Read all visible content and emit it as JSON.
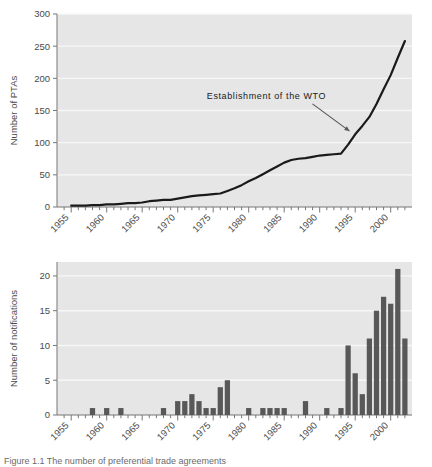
{
  "figure": {
    "caption": "Figure 1.1   The number of preferential trade agreements",
    "background_color": "#e6e6e6",
    "line_color": "#1a1a1a",
    "bar_color": "#585858",
    "grid_color": "#f7f7f7",
    "axis_color": "#777777"
  },
  "chart_data": [
    {
      "type": "line",
      "title": "",
      "xlabel": "",
      "ylabel": "Number of PTAs",
      "xlim": [
        1953,
        2003
      ],
      "ylim": [
        0,
        300
      ],
      "yticks": [
        0,
        50,
        100,
        150,
        200,
        250,
        300
      ],
      "xticks": [
        1955,
        1960,
        1965,
        1970,
        1975,
        1980,
        1985,
        1990,
        1995,
        2000
      ],
      "xtick_labels": [
        "1955",
        "1960",
        "1965",
        "1970",
        "1975",
        "1980",
        "1985",
        "1990",
        "1995",
        "2000"
      ],
      "ytick_labels": [
        "0",
        "50",
        "100",
        "150",
        "200",
        "250",
        "300"
      ],
      "grid": true,
      "legend": "none",
      "annotations": [
        {
          "text": "Establishment of the WTO",
          "text_x": 1982.5,
          "text_y": 168,
          "arrow_to_x": 1994.2,
          "arrow_to_y": 118
        }
      ],
      "x": [
        1955,
        1956,
        1957,
        1958,
        1959,
        1960,
        1961,
        1962,
        1963,
        1964,
        1965,
        1966,
        1967,
        1968,
        1969,
        1970,
        1971,
        1972,
        1973,
        1974,
        1975,
        1976,
        1977,
        1978,
        1979,
        1980,
        1981,
        1982,
        1983,
        1984,
        1985,
        1986,
        1987,
        1988,
        1989,
        1990,
        1991,
        1992,
        1993,
        1994,
        1995,
        1996,
        1997,
        1998,
        1999,
        2000,
        2001,
        2002
      ],
      "values": [
        2,
        2,
        2,
        3,
        3,
        4,
        4,
        5,
        6,
        6,
        7,
        9,
        10,
        11,
        11,
        13,
        15,
        17,
        18,
        19,
        20,
        21,
        25,
        29,
        34,
        40,
        45,
        51,
        57,
        63,
        69,
        73,
        75,
        76,
        78,
        80,
        81,
        82,
        83,
        97,
        113,
        126,
        140,
        160,
        183,
        205,
        232,
        258
      ]
    },
    {
      "type": "bar",
      "title": "",
      "xlabel": "",
      "ylabel": "Number of notifications",
      "xlim": [
        1953,
        2003
      ],
      "ylim": [
        0,
        22
      ],
      "yticks": [
        0,
        5,
        10,
        15,
        20
      ],
      "ytick_labels": [
        "0",
        "5",
        "10",
        "15",
        "20"
      ],
      "xticks": [
        1955,
        1960,
        1965,
        1970,
        1975,
        1980,
        1985,
        1990,
        1995,
        2000
      ],
      "xtick_labels": [
        "1955",
        "1960",
        "1965",
        "1970",
        "1975",
        "1980",
        "1985",
        "1990",
        "1995",
        "2000"
      ],
      "grid": true,
      "legend": "none",
      "categories": [
        1955,
        1956,
        1957,
        1958,
        1959,
        1960,
        1961,
        1962,
        1963,
        1964,
        1965,
        1966,
        1967,
        1968,
        1969,
        1970,
        1971,
        1972,
        1973,
        1974,
        1975,
        1976,
        1977,
        1978,
        1979,
        1980,
        1981,
        1982,
        1983,
        1984,
        1985,
        1986,
        1987,
        1988,
        1989,
        1990,
        1991,
        1992,
        1993,
        1994,
        1995,
        1996,
        1997,
        1998,
        1999,
        2000,
        2001,
        2002
      ],
      "values": [
        0,
        0,
        0,
        1,
        0,
        1,
        0,
        1,
        0,
        0,
        0,
        0,
        0,
        1,
        0,
        2,
        2,
        3,
        2,
        1,
        1,
        4,
        5,
        0,
        0,
        1,
        0,
        1,
        1,
        1,
        1,
        0,
        0,
        2,
        0,
        0,
        1,
        0,
        1,
        10,
        6,
        3,
        11,
        15,
        17,
        16,
        21,
        11
      ]
    }
  ]
}
